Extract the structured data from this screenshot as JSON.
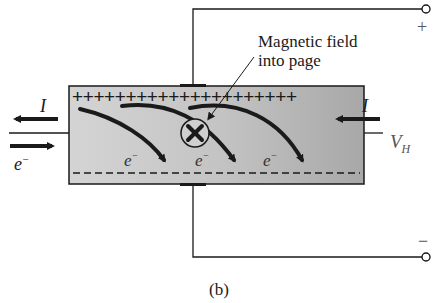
{
  "figure": {
    "caption": "(b)",
    "annotation": {
      "line1": "Magnetic field",
      "line2": "into page"
    },
    "current_left": "I",
    "current_right": "I",
    "electron_left": "e",
    "electron_sup": "−",
    "electrons_inside": [
      "e",
      "e",
      "e"
    ],
    "voltage_label": "V",
    "voltage_sub": "H",
    "terminal_plus": "+",
    "terminal_minus": "−",
    "top_charges": "+++++++++++++++++++++",
    "colors": {
      "ink": "#1a1a1a",
      "plate_fill": "#bdbdbd"
    }
  }
}
